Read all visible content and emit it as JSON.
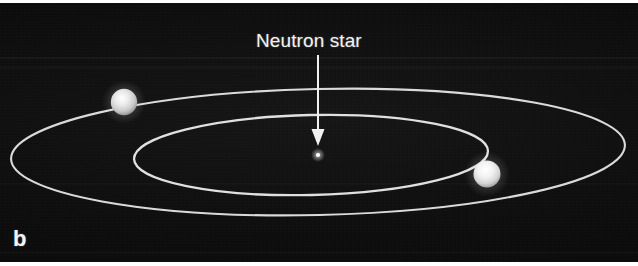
{
  "figure": {
    "panel_letter": "b",
    "background_color": "#0a0a0a",
    "ink_color": "#e8e8e8",
    "width": 638,
    "height": 266
  },
  "annotation": {
    "label": "Neutron star",
    "label_color": "#f2f2f2",
    "arrow": {
      "name": "arrow-down",
      "from_x": 318,
      "from_y": 55,
      "to_x": 318,
      "to_y": 146
    }
  },
  "scene": {
    "neutron_star": {
      "name": "neutron-star-dot",
      "cx": 318,
      "cy": 155,
      "r": 2.2,
      "color": "#ffffff"
    },
    "orbits": [
      {
        "name": "outer-orbit",
        "cx": 318,
        "cy": 152,
        "rx": 307,
        "ry": 64,
        "rotation_deg": -1.2,
        "stroke": "#e6e6e6",
        "stroke_width": 2.1
      },
      {
        "name": "inner-orbit",
        "cx": 311,
        "cy": 154,
        "rx": 177,
        "ry": 41,
        "rotation_deg": -1.2,
        "stroke": "#e6e6e6",
        "stroke_width": 2.3
      }
    ],
    "stars": [
      {
        "name": "companion-star-left",
        "cx": 124,
        "cy": 102,
        "r": 13.5,
        "color": "#e4e4e4"
      },
      {
        "name": "companion-star-right",
        "cx": 487,
        "cy": 174,
        "r": 13.5,
        "color": "#f0f0f0"
      }
    ]
  }
}
